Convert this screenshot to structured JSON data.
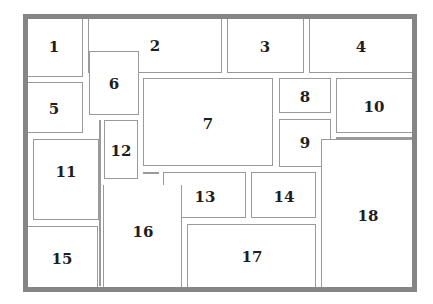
{
  "diagram": {
    "type": "floor-plan-partition",
    "frame_color": "#858585",
    "box_border_color": "#9a9a9a",
    "label_color": "#1e1e1e",
    "regions": [
      {
        "id": "1",
        "label": "1",
        "x": 28,
        "y": 19,
        "w": 55,
        "h": 58,
        "lx": 54,
        "ly": 47
      },
      {
        "id": "2",
        "label": "2",
        "x": 88,
        "y": 19,
        "w": 134,
        "h": 54,
        "lx": 155,
        "ly": 46
      },
      {
        "id": "3",
        "label": "3",
        "x": 227,
        "y": 19,
        "w": 77,
        "h": 54,
        "lx": 265,
        "ly": 47
      },
      {
        "id": "4",
        "label": "4",
        "x": 309,
        "y": 19,
        "w": 103,
        "h": 54,
        "lx": 361,
        "ly": 47
      },
      {
        "id": "5",
        "label": "5",
        "x": 28,
        "y": 82,
        "w": 55,
        "h": 51,
        "lx": 54,
        "ly": 109
      },
      {
        "id": "6",
        "label": "6",
        "x": 89,
        "y": 51,
        "w": 50,
        "h": 64,
        "lx": 114,
        "ly": 84
      },
      {
        "id": "7",
        "label": "7",
        "x": 143,
        "y": 78,
        "w": 130,
        "h": 88,
        "lx": 208,
        "ly": 124
      },
      {
        "id": "8",
        "label": "8",
        "x": 279,
        "y": 78,
        "w": 52,
        "h": 35,
        "lx": 305,
        "ly": 97
      },
      {
        "id": "9",
        "label": "9",
        "x": 279,
        "y": 119,
        "w": 52,
        "h": 48,
        "lx": 305,
        "ly": 143
      },
      {
        "id": "10",
        "label": "10",
        "x": 336,
        "y": 78,
        "w": 76,
        "h": 55,
        "lx": 374,
        "ly": 107
      },
      {
        "id": "11",
        "label": "11",
        "x": 33,
        "y": 139,
        "w": 66,
        "h": 81,
        "lx": 66,
        "ly": 172
      },
      {
        "id": "12",
        "label": "12",
        "x": 104,
        "y": 120,
        "w": 34,
        "h": 59,
        "lx": 121,
        "ly": 151
      },
      {
        "id": "13",
        "label": "13",
        "x": 163,
        "y": 172,
        "w": 83,
        "h": 46,
        "lx": 205,
        "ly": 197
      },
      {
        "id": "14",
        "label": "14",
        "x": 251,
        "y": 172,
        "w": 65,
        "h": 46,
        "lx": 284,
        "ly": 197
      },
      {
        "id": "15",
        "label": "15",
        "x": 28,
        "y": 226,
        "w": 70,
        "h": 61,
        "lx": 62,
        "ly": 259
      },
      {
        "id": "16",
        "label": "16",
        "x": 103,
        "y": 185,
        "w": 79,
        "h": 102,
        "lx": 143,
        "ly": 232
      },
      {
        "id": "17",
        "label": "17",
        "x": 187,
        "y": 224,
        "w": 129,
        "h": 63,
        "lx": 252,
        "ly": 257
      },
      {
        "id": "18",
        "label": "18",
        "x": 321,
        "y": 139,
        "w": 91,
        "h": 148,
        "lx": 368,
        "ly": 216
      }
    ]
  }
}
